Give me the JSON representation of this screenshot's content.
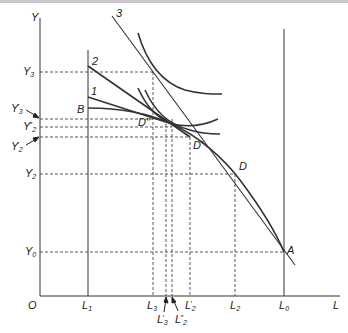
{
  "diagram": {
    "type": "economic-graph",
    "axes": {
      "x_label": "L",
      "y_label": "Y",
      "origin_label": "O"
    },
    "y_labels": [
      {
        "id": "Y3",
        "main": "Y",
        "sub": "3",
        "prime": ""
      },
      {
        "id": "Y3p",
        "main": "Y",
        "sub": "3",
        "prime": "′"
      },
      {
        "id": "Y2pp",
        "main": "Y",
        "sub": "2",
        "prime": "″"
      },
      {
        "id": "Y2p",
        "main": "Y",
        "sub": "2",
        "prime": "′"
      },
      {
        "id": "Y2",
        "main": "Y",
        "sub": "2",
        "prime": ""
      },
      {
        "id": "Y0",
        "main": "Y",
        "sub": "0",
        "prime": ""
      }
    ],
    "x_labels": [
      {
        "id": "L1",
        "main": "L",
        "sub": "1",
        "prime": ""
      },
      {
        "id": "L3",
        "main": "L",
        "sub": "3",
        "prime": ""
      },
      {
        "id": "L3p",
        "main": "L",
        "sub": "3",
        "prime": "′"
      },
      {
        "id": "L2pp",
        "main": "L",
        "sub": "2",
        "prime": "″"
      },
      {
        "id": "L2p",
        "main": "L",
        "sub": "2",
        "prime": "′"
      },
      {
        "id": "L2",
        "main": "L",
        "sub": "2",
        "prime": ""
      },
      {
        "id": "L0",
        "main": "L",
        "sub": "0",
        "prime": ""
      }
    ],
    "points": [
      {
        "id": "A",
        "label": "A"
      },
      {
        "id": "B",
        "label": "B"
      },
      {
        "id": "D",
        "label": "D"
      },
      {
        "id": "Dp",
        "label": "D′"
      },
      {
        "id": "Dpp",
        "label": "D″"
      }
    ],
    "curve_labels": [
      "1",
      "2",
      "3"
    ]
  }
}
